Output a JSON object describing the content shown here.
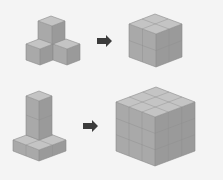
{
  "diagram": {
    "title": "Cube assembly puzzle",
    "rows": [
      {
        "source_shape": "four-cube tripod (1 cube atop 3 cubes)",
        "source_cube_count": 4,
        "arrow": "right-arrow",
        "target_shape": "2x2x2 cube",
        "target_dimensions": "2x2x2",
        "target_cube_count": 8
      },
      {
        "source_shape": "L-shape: 3-cube column on 2x2 base",
        "source_cube_count": 6,
        "arrow": "right-arrow",
        "target_shape": "3x3x3 cube",
        "target_dimensions": "3x3x3",
        "target_cube_count": 27
      }
    ],
    "colors": {
      "background": "#f4f4f4",
      "cube_top": "#c4c4c4",
      "cube_left": "#a9a9a9",
      "cube_right": "#9a9a9a",
      "arrow": "#3b3b3b"
    }
  }
}
